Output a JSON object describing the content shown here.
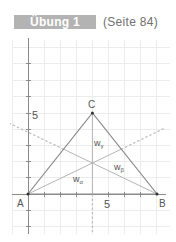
{
  "header": {
    "exercise_label": "Übung 1",
    "page_reference": "(Seite 84)"
  },
  "diagram": {
    "type": "triangle-angle-bisectors",
    "axis_labels": {
      "y_tick_5": "5",
      "x_tick_5": "5"
    },
    "points": [
      {
        "name": "A",
        "x": 0,
        "y": 0,
        "label": "A"
      },
      {
        "name": "B",
        "x": 8,
        "y": 0,
        "label": "B"
      },
      {
        "name": "C",
        "x": 4,
        "y": 5,
        "label": "C"
      }
    ],
    "bisectors": [
      {
        "name": "w_alpha",
        "label_main": "w",
        "label_sub": "α"
      },
      {
        "name": "w_beta",
        "label_main": "w",
        "label_sub": "β"
      },
      {
        "name": "w_gamma",
        "label_main": "w",
        "label_sub": "γ"
      }
    ],
    "colors": {
      "header_bg": "#b3b3b3",
      "grid": "#ececec",
      "axis": "#8a8a8a",
      "triangle": "#8a8a8a",
      "bisector": "#b5b5b5",
      "dashed": "#c0c0c0",
      "point": "#333333"
    }
  }
}
